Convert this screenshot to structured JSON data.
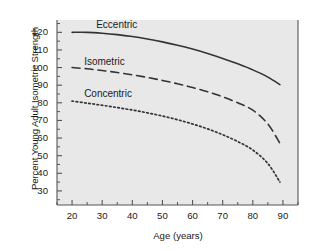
{
  "figure": {
    "background_color": "#ffffff",
    "plot_background_color": "#e8e8e8",
    "axis_color": "#555555",
    "line_color": "#333333"
  },
  "chart_data": {
    "type": "line",
    "title": "",
    "xlabel": "Age (years)",
    "ylabel": "Percent Young Adult Isometric Strength",
    "xlim": [
      15,
      95
    ],
    "ylim": [
      22,
      127
    ],
    "xticks": [
      20,
      30,
      40,
      50,
      60,
      70,
      80,
      90
    ],
    "yticks": [
      30,
      40,
      50,
      60,
      70,
      80,
      90,
      100,
      110,
      120
    ],
    "xtick_labels": [
      "20",
      "30",
      "40",
      "50",
      "60",
      "70",
      "80",
      "90"
    ],
    "ytick_labels": [
      "30",
      "40",
      "50",
      "60",
      "70",
      "80",
      "90",
      "100",
      "110",
      "120"
    ],
    "grid": false,
    "legend_position": "inline-above-curve",
    "x": [
      20,
      25,
      30,
      35,
      40,
      45,
      50,
      55,
      60,
      65,
      70,
      75,
      80,
      85,
      89
    ],
    "series": [
      {
        "name": "Eccentric",
        "style": "solid",
        "color": "#333333",
        "label_x": 30,
        "label_y": 124,
        "values": [
          120.0,
          120.0,
          119.5,
          118.7,
          117.6,
          116.2,
          114.6,
          112.7,
          110.5,
          108.0,
          105.2,
          102.1,
          98.7,
          94.6,
          90.3
        ]
      },
      {
        "name": "Isometric",
        "style": "dashed",
        "color": "#333333",
        "label_x": 26,
        "label_y": 103,
        "values": [
          100.0,
          99.3,
          98.3,
          97.2,
          95.9,
          94.4,
          92.7,
          90.8,
          88.7,
          86.3,
          83.4,
          80.0,
          75.8,
          68.0,
          57.0
        ]
      },
      {
        "name": "Concentric",
        "style": "dotted",
        "color": "#333333",
        "label_x": 26,
        "label_y": 85,
        "values": [
          81.0,
          79.8,
          78.6,
          77.3,
          75.9,
          74.3,
          72.5,
          70.4,
          68.0,
          65.2,
          61.9,
          58.0,
          53.2,
          45.5,
          35.0
        ]
      }
    ]
  }
}
